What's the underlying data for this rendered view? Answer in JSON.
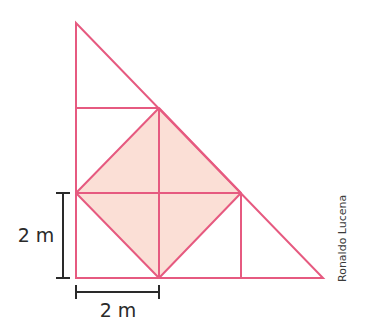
{
  "diagram": {
    "type": "geometry-figure",
    "colors": {
      "stroke": "#e65a80",
      "fill": "#fbdfd6",
      "dimension_line": "#2a2a2a",
      "text": "#2a2a2a",
      "background": "#ffffff"
    },
    "dimensions": {
      "vertical": {
        "label": "2 m"
      },
      "horizontal": {
        "label": "2 m"
      }
    },
    "credit": "Ronaldo Lucena"
  }
}
